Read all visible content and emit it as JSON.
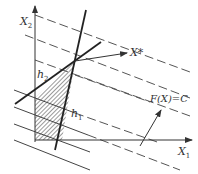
{
  "diagram": {
    "type": "linear-programming-graphical-solution",
    "axes": {
      "x_label": "X",
      "x_sub": "1",
      "y_label": "X",
      "y_sub": "2"
    },
    "constraints": [
      {
        "label": "h",
        "sub": "1"
      },
      {
        "label": "h",
        "sub": "2"
      }
    ],
    "optimum": {
      "label": "X*"
    },
    "objective": {
      "label": "F(X)=C"
    },
    "colors": {
      "line": "#333333",
      "dashed": "#555555",
      "hatch": "#666666",
      "background": "#ffffff"
    }
  }
}
